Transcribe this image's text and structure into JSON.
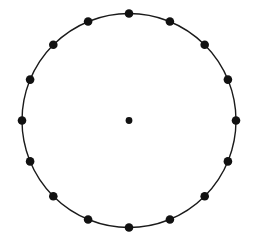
{
  "figure": {
    "canvas": {
      "width": 257,
      "height": 241,
      "background_color": "#FFFFFF"
    },
    "stroke_color": "#1A1A1A",
    "point_color": "#111111",
    "circle": {
      "center_x": 129,
      "center_y": 120.5,
      "radius": 107,
      "stroke_width": 1.4
    },
    "center_point": {
      "label": "center",
      "x": 129,
      "y": 120.5,
      "radius": 3.4
    },
    "boundary_points": {
      "count": 16,
      "angular_step_degrees": 22.5,
      "start_angle_degrees": 90,
      "marker_radius": 4.3,
      "items": [
        {
          "index": 0,
          "angle_degrees": 90,
          "x": 129.0,
          "y": 13.5
        },
        {
          "index": 1,
          "angle_degrees": 67.5,
          "x": 169.9,
          "y": 21.5
        },
        {
          "index": 2,
          "angle_degrees": 45,
          "x": 204.7,
          "y": 44.8
        },
        {
          "index": 3,
          "angle_degrees": 22.5,
          "x": 227.9,
          "y": 79.6
        },
        {
          "index": 4,
          "angle_degrees": 0,
          "x": 236.0,
          "y": 120.5
        },
        {
          "index": 5,
          "angle_degrees": 337.5,
          "x": 227.9,
          "y": 161.4
        },
        {
          "index": 6,
          "angle_degrees": 315,
          "x": 204.7,
          "y": 196.2
        },
        {
          "index": 7,
          "angle_degrees": 292.5,
          "x": 169.9,
          "y": 219.5
        },
        {
          "index": 8,
          "angle_degrees": 270,
          "x": 129.0,
          "y": 227.5
        },
        {
          "index": 9,
          "angle_degrees": 247.5,
          "x": 88.1,
          "y": 219.5
        },
        {
          "index": 10,
          "angle_degrees": 225,
          "x": 53.3,
          "y": 196.2
        },
        {
          "index": 11,
          "angle_degrees": 202.5,
          "x": 30.1,
          "y": 161.4
        },
        {
          "index": 12,
          "angle_degrees": 180,
          "x": 22.0,
          "y": 120.5
        },
        {
          "index": 13,
          "angle_degrees": 157.5,
          "x": 30.1,
          "y": 79.6
        },
        {
          "index": 14,
          "angle_degrees": 135,
          "x": 53.3,
          "y": 44.8
        },
        {
          "index": 15,
          "angle_degrees": 112.5,
          "x": 88.1,
          "y": 21.5
        }
      ]
    }
  }
}
